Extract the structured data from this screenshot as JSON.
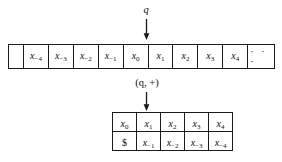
{
  "figure": {
    "head_state_label": "q",
    "pair_state_label": "(q, +)",
    "tape": {
      "leading_blank": "",
      "cells": [
        {
          "base": "x",
          "sub": "−4"
        },
        {
          "base": "x",
          "sub": "−3"
        },
        {
          "base": "x",
          "sub": "−2"
        },
        {
          "base": "x",
          "sub": "−1"
        },
        {
          "base": "x",
          "sub": "0"
        },
        {
          "base": "x",
          "sub": "1"
        },
        {
          "base": "x",
          "sub": "2"
        },
        {
          "base": "x",
          "sub": "3"
        },
        {
          "base": "x",
          "sub": "4"
        }
      ],
      "ellipsis": "· · ·",
      "head_cell_index": 5
    },
    "pair_table": {
      "rows": [
        [
          {
            "base": "x",
            "sub": "0"
          },
          {
            "base": "x",
            "sub": "1"
          },
          {
            "base": "x",
            "sub": "2"
          },
          {
            "base": "x",
            "sub": "3"
          },
          {
            "base": "x",
            "sub": "4"
          }
        ],
        [
          {
            "base": "$",
            "sub": ""
          },
          {
            "base": "x",
            "sub": "−1"
          },
          {
            "base": "x",
            "sub": "−2"
          },
          {
            "base": "x",
            "sub": "−3"
          },
          {
            "base": "x",
            "sub": "−4"
          }
        ]
      ],
      "head_column_index": 1
    },
    "colors": {
      "ink": "#1a1a1a",
      "background": "#ffffff"
    }
  }
}
